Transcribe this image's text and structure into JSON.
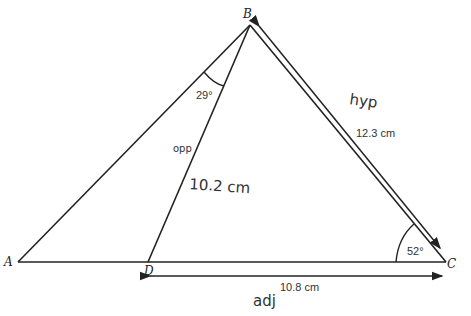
{
  "diagram": {
    "vertices": {
      "A": {
        "label": "A",
        "x": 18,
        "y": 262
      },
      "B": {
        "label": "B",
        "x": 250,
        "y": 25
      },
      "C": {
        "label": "C",
        "x": 446,
        "y": 262
      },
      "D": {
        "label": "D",
        "x": 148,
        "y": 262
      }
    },
    "angles": {
      "ABD": "29°",
      "BCA": "52°"
    },
    "measurements": {
      "BC": "12.3 cm",
      "DC": "10.8 cm"
    },
    "handwritten": {
      "hyp": "hyp",
      "opp": "opp",
      "bd_length": "10.2 cm",
      "adj": "adj"
    },
    "colors": {
      "stroke": "#222222",
      "background": "#ffffff"
    }
  }
}
